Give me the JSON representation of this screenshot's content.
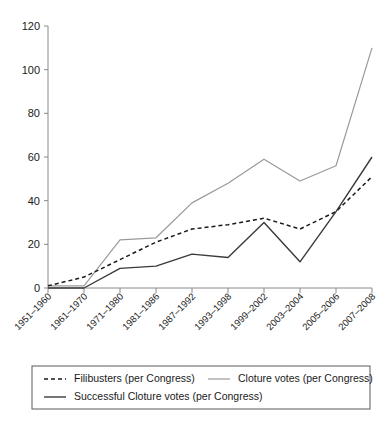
{
  "chart_data": {
    "type": "line",
    "title": "",
    "subtitle": "",
    "xlabel": "",
    "ylabel": "",
    "ylim": [
      0,
      120
    ],
    "ytick_values": [
      0,
      20,
      40,
      60,
      80,
      100,
      120
    ],
    "ytick_labels": [
      "0",
      "20",
      "40",
      "60",
      "80",
      "100",
      "120"
    ],
    "grid": false,
    "legend_position": "bottom",
    "categories": [
      "1951–1960",
      "1961–1970",
      "1971–1980",
      "1981–1986",
      "1987–1992",
      "1993–1998",
      "1999–2002",
      "2003–2004",
      "2005–2006",
      "2007–2008"
    ],
    "series": [
      {
        "name": "Filibusters (per Congress)",
        "style": "dashed",
        "color": "#1a1a1a",
        "values": [
          1,
          5,
          13,
          21,
          27,
          29,
          32,
          27,
          35,
          51
        ]
      },
      {
        "name": "Cloture votes (per Congress)",
        "style": "solid-light",
        "color": "#9a9a9a",
        "values": [
          1,
          1,
          22,
          23,
          39,
          48,
          59,
          49,
          56,
          110
        ]
      },
      {
        "name": "Successful Cloture votes (per Congress)",
        "style": "solid-dark",
        "color": "#3a3a3a",
        "values": [
          0,
          0,
          9,
          10,
          15.5,
          14,
          30,
          12,
          35,
          60
        ]
      }
    ]
  },
  "legend": {
    "entries": [
      {
        "label": "Filibusters (per Congress)"
      },
      {
        "label": "Cloture votes (per Congress)"
      },
      {
        "label": "Successful Cloture votes (per Congress)"
      }
    ]
  }
}
